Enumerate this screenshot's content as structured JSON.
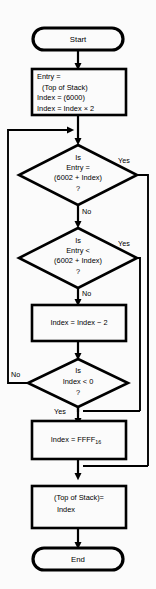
{
  "diagram": {
    "background_color": "#fbfbfb",
    "line_color": "#000000"
  },
  "nodes": {
    "start": {
      "type": "terminal",
      "label": "Start"
    },
    "init": {
      "type": "process",
      "line1": "Entry =",
      "line2": "(Top of Stack)",
      "line3": "Index = (6000)",
      "line4": "Index = Index × 2"
    },
    "decision_equal": {
      "type": "decision",
      "line1": "Is",
      "line2": "Entry =",
      "line3": "(6002 + Index)",
      "line4": "?"
    },
    "decision_less": {
      "type": "decision",
      "line1": "Is",
      "line2": "Entry <",
      "line3": "(6002 + Index)",
      "line4": "?"
    },
    "decrement": {
      "type": "process",
      "line1": "Index = Index − 2"
    },
    "decision_negative": {
      "type": "decision",
      "line1": "Is",
      "line2": "Index < 0",
      "line3": "?"
    },
    "set_ffff": {
      "type": "process",
      "line1": "Index = FFFF",
      "subscript": "16"
    },
    "store": {
      "type": "process",
      "line1": "(Top of Stack)=",
      "line2": "Index"
    },
    "end": {
      "type": "terminal",
      "label": "End"
    }
  },
  "edge_labels": {
    "equal_yes": "Yes",
    "equal_no": "No",
    "less_yes": "Yes",
    "less_no": "No",
    "negative_no": "No",
    "negative_yes": "Yes"
  }
}
